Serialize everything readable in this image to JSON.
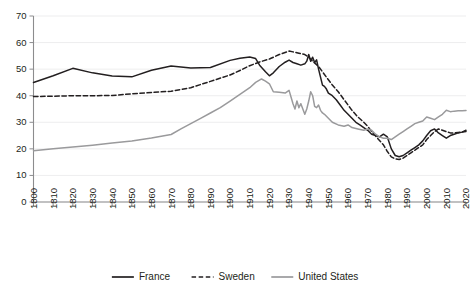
{
  "chart_data": {
    "type": "line",
    "title": "",
    "subtitle": "",
    "xlabel": "",
    "ylabel": "",
    "xlim": [
      1800,
      2020
    ],
    "ylim": [
      0,
      70
    ],
    "grid": true,
    "legend_position": "bottom",
    "x_ticks": [
      "1800",
      "1810",
      "1820",
      "1830",
      "1840",
      "1850",
      "1860",
      "1870",
      "1880",
      "1890",
      "1900",
      "1910",
      "1920",
      "1930",
      "1940",
      "1950",
      "1960",
      "1970",
      "1980",
      "1990",
      "2000",
      "2010",
      "2020"
    ],
    "y_ticks": [
      "0",
      "10",
      "20",
      "30",
      "40",
      "50",
      "60",
      "70"
    ],
    "series": [
      {
        "name": "France",
        "color": "#231f20",
        "dash": "none",
        "x": [
          1800,
          1810,
          1820,
          1830,
          1840,
          1850,
          1860,
          1870,
          1880,
          1890,
          1900,
          1905,
          1910,
          1913,
          1915,
          1918,
          1920,
          1922,
          1925,
          1928,
          1930,
          1932,
          1934,
          1936,
          1938,
          1939,
          1940,
          1941,
          1942,
          1943,
          1944,
          1945,
          1946,
          1947,
          1948,
          1949,
          1950,
          1952,
          1954,
          1956,
          1958,
          1960,
          1962,
          1964,
          1966,
          1968,
          1970,
          1972,
          1974,
          1976,
          1978,
          1980,
          1982,
          1984,
          1986,
          1988,
          1990,
          1992,
          1994,
          1996,
          1998,
          2000,
          2002,
          2004,
          2006,
          2008,
          2010,
          2012,
          2014,
          2016,
          2018,
          2020
        ],
        "y": [
          45.0,
          47.5,
          50.3,
          48.6,
          47.4,
          47.1,
          49.6,
          51.2,
          50.4,
          50.6,
          53.3,
          54.1,
          54.6,
          54.0,
          51.5,
          49.0,
          47.5,
          48.6,
          51.0,
          52.6,
          53.4,
          52.5,
          52.0,
          51.5,
          52.0,
          53.0,
          55.5,
          53.0,
          54.5,
          52.5,
          53.5,
          50.0,
          47.0,
          44.0,
          43.5,
          42.5,
          41.0,
          40.0,
          38.5,
          36.5,
          34.5,
          33.0,
          31.5,
          30.0,
          29.0,
          28.0,
          27.0,
          25.5,
          25.0,
          24.5,
          25.5,
          24.5,
          20.0,
          17.5,
          17.0,
          17.5,
          18.5,
          19.5,
          20.5,
          21.5,
          23.0,
          25.0,
          26.8,
          27.5,
          26.0,
          25.0,
          24.0,
          25.0,
          25.5,
          26.0,
          26.3,
          27.0
        ]
      },
      {
        "name": "Sweden",
        "color": "#231f20",
        "dash": "dashed",
        "x": [
          1800,
          1810,
          1820,
          1830,
          1840,
          1850,
          1860,
          1870,
          1880,
          1890,
          1900,
          1905,
          1910,
          1915,
          1920,
          1925,
          1930,
          1932,
          1935,
          1938,
          1940,
          1942,
          1945,
          1948,
          1950,
          1952,
          1955,
          1958,
          1960,
          1962,
          1965,
          1968,
          1970,
          1972,
          1975,
          1978,
          1980,
          1982,
          1984,
          1986,
          1988,
          1990,
          1992,
          1994,
          1996,
          1998,
          2000,
          2002,
          2004,
          2006,
          2008,
          2010,
          2012,
          2014,
          2016,
          2018,
          2020
        ],
        "y": [
          39.7,
          39.8,
          40.0,
          40.0,
          40.1,
          40.7,
          41.2,
          41.7,
          43.0,
          45.4,
          47.8,
          49.5,
          51.3,
          52.7,
          53.8,
          55.5,
          56.8,
          56.5,
          56.0,
          55.5,
          54.5,
          53.0,
          51.0,
          48.0,
          46.0,
          44.0,
          41.5,
          38.5,
          36.5,
          34.5,
          32.0,
          30.0,
          28.5,
          26.5,
          24.0,
          21.5,
          19.0,
          17.0,
          16.2,
          16.0,
          16.5,
          17.5,
          18.5,
          19.5,
          20.5,
          21.5,
          23.5,
          25.0,
          26.5,
          27.5,
          27.0,
          26.5,
          26.0,
          26.0,
          26.2,
          26.3,
          26.5
        ]
      },
      {
        "name": "United States",
        "color": "#9a9a9c",
        "dash": "none",
        "x": [
          1800,
          1810,
          1820,
          1830,
          1840,
          1850,
          1860,
          1870,
          1875,
          1880,
          1885,
          1890,
          1895,
          1900,
          1905,
          1910,
          1913,
          1916,
          1918,
          1920,
          1922,
          1925,
          1928,
          1930,
          1932,
          1933,
          1934,
          1935,
          1936,
          1937,
          1938,
          1939,
          1940,
          1941,
          1942,
          1943,
          1944,
          1945,
          1946,
          1947,
          1948,
          1950,
          1952,
          1955,
          1958,
          1960,
          1962,
          1965,
          1968,
          1970,
          1972,
          1974,
          1976,
          1978,
          1980,
          1982,
          1984,
          1986,
          1988,
          1990,
          1992,
          1994,
          1996,
          1998,
          2000,
          2002,
          2004,
          2006,
          2008,
          2010,
          2012,
          2014,
          2016,
          2018,
          2020
        ],
        "y": [
          19.3,
          20.0,
          20.7,
          21.4,
          22.2,
          23.0,
          24.1,
          25.4,
          27.5,
          29.5,
          31.5,
          33.5,
          35.5,
          38.0,
          40.5,
          43.0,
          45.0,
          46.3,
          45.5,
          44.5,
          41.5,
          41.3,
          41.0,
          42.0,
          37.0,
          35.0,
          38.0,
          35.5,
          37.0,
          35.0,
          33.0,
          35.0,
          38.0,
          41.5,
          40.0,
          36.0,
          35.5,
          36.5,
          34.5,
          33.5,
          33.0,
          31.5,
          30.0,
          29.0,
          28.5,
          29.0,
          28.0,
          27.5,
          27.0,
          27.5,
          27.0,
          25.5,
          24.5,
          24.0,
          24.0,
          23.5,
          24.5,
          25.5,
          26.5,
          27.5,
          28.5,
          29.5,
          30.0,
          30.5,
          32.0,
          31.5,
          31.0,
          32.0,
          33.0,
          34.5,
          34.0,
          34.2,
          34.3,
          34.3,
          34.4
        ]
      }
    ]
  },
  "legend": {
    "items": [
      {
        "label": "France",
        "color": "#231f20",
        "style": "solid"
      },
      {
        "label": "Sweden",
        "color": "#231f20",
        "style": "dashed"
      },
      {
        "label": "United States",
        "color": "#9a9a9c",
        "style": "solid"
      }
    ]
  },
  "axes": {
    "y_axis_color": "#8c8c8e",
    "x_axis_color": "#8c8c8e",
    "grid_color": "#e9e9ea"
  }
}
